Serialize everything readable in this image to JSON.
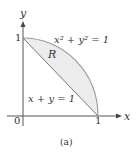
{
  "figure": {
    "caption": "(a)",
    "axes": {
      "x_label": "x",
      "y_label": "y",
      "origin_label": "0",
      "x_tick_label": "1",
      "y_tick_label": "1"
    },
    "curves": {
      "circle_label": "x² + y² = 1",
      "line_label": "x + y = 1"
    },
    "region_label": "R",
    "colors": {
      "axis": "#555555",
      "curve": "#999999",
      "region_fill": "#ececec",
      "text": "#333333"
    }
  }
}
